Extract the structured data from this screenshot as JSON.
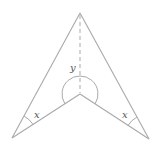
{
  "diagram": {
    "type": "arrowhead-geometry",
    "points": {
      "apex": [
        80,
        13
      ],
      "inner_vertex": [
        80,
        94
      ],
      "left_tip": [
        12,
        138
      ],
      "right_tip": [
        149,
        139
      ]
    },
    "labels": {
      "y": "y",
      "x_left": "x",
      "x_right": "x"
    },
    "angles": [
      {
        "name": "y",
        "at": "inner_vertex",
        "description": "reflex angle at inner vertex"
      },
      {
        "name": "x",
        "at": "left_tip"
      },
      {
        "name": "x",
        "at": "right_tip"
      }
    ],
    "dashed_line": {
      "from": "apex",
      "to": "inner_vertex"
    },
    "colors": {
      "line": "#a9a9a9",
      "label": "#555555",
      "background": "#ffffff"
    }
  }
}
